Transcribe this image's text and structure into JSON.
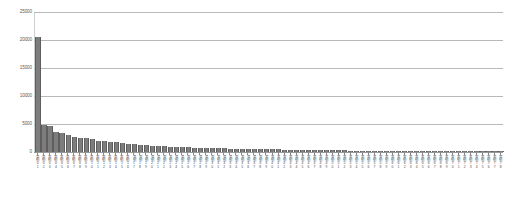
{
  "chart_data": {
    "type": "bar",
    "title": "",
    "subtitle": "",
    "xlabel": "",
    "ylabel": "",
    "ylim": [
      0,
      25000
    ],
    "ytick_values": [
      0,
      5000,
      10000,
      15000,
      20000,
      25000
    ],
    "ytick_labels": [
      "0",
      "5000",
      "10000",
      "15000",
      "20000",
      "25000"
    ],
    "grid": true,
    "grid_axis": "y",
    "legend": false,
    "legend_position": "none",
    "bar_color": "#7d7d7d",
    "bar_edge_color": "#5e5e5e",
    "gridline_color": "#b8b8b8",
    "note": "Long-tail ranked bar chart. X tick labels are rotated vertical CJK text rendered too small to resolve individual glyphs at source resolution; they are represented as vertical label placeholders.",
    "categories": [
      "类别01",
      "类别02",
      "类别03",
      "类别04",
      "类别05",
      "类别06",
      "类别07",
      "类别08",
      "类别09",
      "类别10",
      "类别11",
      "类别12",
      "类别13",
      "类别14",
      "类别15",
      "类别16",
      "类别17",
      "类别18",
      "类别19",
      "类别20",
      "类别21",
      "类别22",
      "类别23",
      "类别24",
      "类别25",
      "类别26",
      "类别27",
      "类别28",
      "类别29",
      "类别30",
      "类别31",
      "类别32",
      "类别33",
      "类别34",
      "类别35",
      "类别36",
      "类别37",
      "类别38",
      "类别39",
      "类别40",
      "类别41",
      "类别42",
      "类别43",
      "类别44",
      "类别45",
      "类别46",
      "类别47",
      "类别48",
      "类别49",
      "类别50",
      "类别51",
      "类别52",
      "类别53",
      "类别54",
      "类别55",
      "类别56",
      "类别57",
      "类别58",
      "类别59",
      "类别60",
      "类别61",
      "类别62",
      "类别63",
      "类别64",
      "类别65",
      "类别66",
      "类别67",
      "类别68",
      "类别69",
      "类别70",
      "类别71",
      "类别72",
      "类别73",
      "类别74",
      "类别75",
      "类别76",
      "类别77",
      "类别78"
    ],
    "values": [
      20500,
      4800,
      4600,
      3600,
      3350,
      3100,
      2750,
      2500,
      2450,
      2300,
      2050,
      1900,
      1800,
      1700,
      1600,
      1450,
      1350,
      1250,
      1200,
      1120,
      1050,
      1000,
      950,
      900,
      860,
      820,
      790,
      760,
      730,
      700,
      670,
      640,
      620,
      600,
      575,
      550,
      530,
      510,
      490,
      470,
      450,
      430,
      415,
      400,
      385,
      370,
      355,
      340,
      325,
      310,
      300,
      285,
      270,
      258,
      245,
      233,
      222,
      210,
      200,
      190,
      180,
      170,
      162,
      153,
      145,
      137,
      130,
      122,
      115,
      108,
      100,
      92,
      85,
      78,
      70,
      60,
      50,
      38
    ]
  }
}
